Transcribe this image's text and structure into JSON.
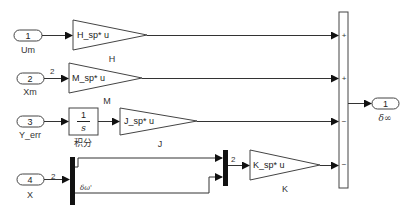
{
  "diagram": {
    "type": "simulink-block-diagram",
    "inports": [
      {
        "number": "1",
        "name": "Um"
      },
      {
        "number": "2",
        "name": "Xm",
        "signal_width": "2"
      },
      {
        "number": "3",
        "name": "Y_err"
      },
      {
        "number": "4",
        "name": "X",
        "signal_width": "2"
      }
    ],
    "gains": [
      {
        "name": "H",
        "expression": "H_sp* u"
      },
      {
        "name": "M",
        "expression": "M_sp* u"
      },
      {
        "name": "J",
        "expression": "J_sp* u"
      },
      {
        "name": "K",
        "expression": "K_sp* u"
      }
    ],
    "integrator": {
      "numerator": "1",
      "denominator": "s",
      "name": "积分"
    },
    "demux": {
      "lower_signal_label": "δω'"
    },
    "mux": {
      "output_width": "2"
    },
    "sum": {
      "signs": [
        "+",
        "+",
        "−",
        "−"
      ]
    },
    "outport": {
      "number": "1",
      "name": "δ∞"
    }
  }
}
